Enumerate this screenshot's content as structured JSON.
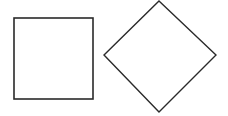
{
  "diagram": {
    "background": "#ffffff",
    "stroke_color": "#2a2a2a",
    "shapes": [
      {
        "type": "square",
        "x": 14,
        "y": 18,
        "width": 79,
        "height": 81
      },
      {
        "type": "diamond",
        "points": "159,1 216,55 159,112 104,55"
      }
    ]
  }
}
